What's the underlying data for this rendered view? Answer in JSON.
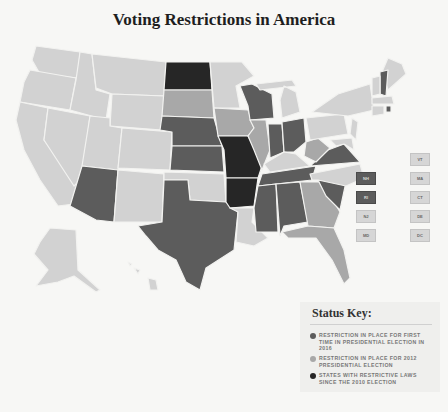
{
  "title": "Voting Restrictions in America",
  "colors": {
    "background": "#f7f7f5",
    "no_restriction": "#d2d2d2",
    "first_time_2016": "#5c5c5c",
    "in_place_2012": "#a8a8a8",
    "restrictive_since_2010": "#262626"
  },
  "small_states": {
    "left_column": [
      {
        "abbr": "NH",
        "status": "first_time_2016"
      },
      {
        "abbr": "RI",
        "status": "first_time_2016"
      },
      {
        "abbr": "NJ",
        "status": "none"
      },
      {
        "abbr": "MD",
        "status": "none"
      }
    ],
    "right_column": [
      {
        "abbr": "VT",
        "status": "none"
      },
      {
        "abbr": "MA",
        "status": "none"
      },
      {
        "abbr": "CT",
        "status": "none"
      },
      {
        "abbr": "DE",
        "status": "none"
      },
      {
        "abbr": "DC",
        "status": "none"
      }
    ]
  },
  "status_key": {
    "heading": "Status Key:",
    "items": [
      {
        "label": "RESTRICTION IN PLACE FOR FIRST TIME IN PRESIDENTIAL ELECTION IN 2016",
        "color": "#5c5c5c"
      },
      {
        "label": "RESTRICTION IN PLACE FOR 2012 PRESIDENTIAL ELECTION",
        "color": "#a8a8a8"
      },
      {
        "label": "STATES WITH RESTRICTIVE LAWS SINCE THE 2010 ELECTION",
        "color": "#262626"
      }
    ]
  },
  "states": {
    "first_time_2016": [
      "AZ",
      "NE",
      "KS",
      "TX",
      "WI",
      "IN",
      "OH",
      "VA",
      "MS",
      "AL",
      "TN",
      "SC",
      "NH",
      "RI"
    ],
    "in_place_2012": [
      "SD",
      "IA",
      "IL",
      "WV",
      "GA",
      "FL"
    ],
    "restrictive_since_2010": [
      "ND",
      "MO",
      "AR"
    ]
  }
}
